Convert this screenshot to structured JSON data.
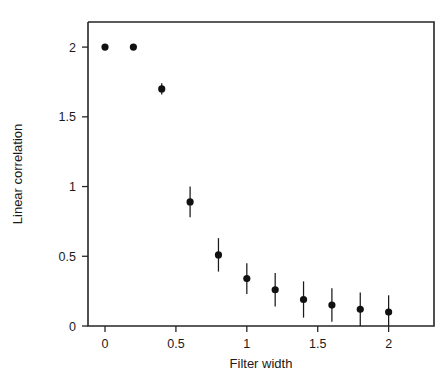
{
  "chart_data": {
    "type": "scatter",
    "title": "",
    "xlabel": "Filter width",
    "ylabel": "Linear correlation",
    "xlim": [
      -0.12,
      2.32
    ],
    "ylim": [
      0,
      2.18
    ],
    "grid": false,
    "legend": null,
    "xticks": [
      0,
      0.5,
      1,
      1.5,
      2
    ],
    "xtick_labels": [
      "0",
      "0.5",
      "1",
      "1.5",
      "2"
    ],
    "yticks": [
      0,
      0.5,
      1,
      1.5,
      2
    ],
    "ytick_labels": [
      "0",
      "0.5",
      "1",
      "1.5",
      "2"
    ],
    "marker": "filled-circle",
    "marker_color": "#111111",
    "errorbar_color": "#1a1a1a",
    "x": [
      0,
      0.2,
      0.4,
      0.6,
      0.8,
      1.0,
      1.2,
      1.4,
      1.6,
      1.8,
      2.0
    ],
    "values": [
      2.0,
      2.0,
      1.7,
      0.89,
      0.51,
      0.34,
      0.26,
      0.19,
      0.15,
      0.12,
      0.1
    ],
    "yerr": [
      0.0,
      0.0,
      0.04,
      0.11,
      0.12,
      0.11,
      0.12,
      0.13,
      0.12,
      0.12,
      0.12
    ],
    "points": [
      {
        "x": 0,
        "y": 2.0,
        "err": 0.0
      },
      {
        "x": 0.2,
        "y": 2.0,
        "err": 0.0
      },
      {
        "x": 0.4,
        "y": 1.7,
        "err": 0.04
      },
      {
        "x": 0.6,
        "y": 0.89,
        "err": 0.11
      },
      {
        "x": 0.8,
        "y": 0.51,
        "err": 0.12
      },
      {
        "x": 1.0,
        "y": 0.34,
        "err": 0.11
      },
      {
        "x": 1.2,
        "y": 0.26,
        "err": 0.12
      },
      {
        "x": 1.4,
        "y": 0.19,
        "err": 0.13
      },
      {
        "x": 1.6,
        "y": 0.15,
        "err": 0.12
      },
      {
        "x": 1.8,
        "y": 0.12,
        "err": 0.12
      },
      {
        "x": 2.0,
        "y": 0.1,
        "err": 0.12
      }
    ]
  }
}
